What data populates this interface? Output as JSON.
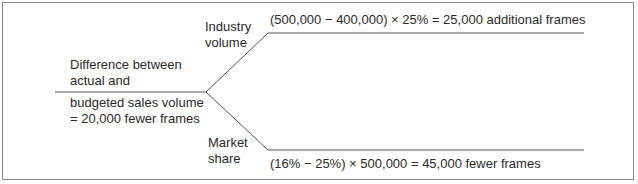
{
  "diagram": {
    "root": {
      "label_above": [
        "Difference between",
        "actual and"
      ],
      "label_below": [
        "budgeted sales volume",
        "= 20,000 fewer frames"
      ]
    },
    "branches": [
      {
        "name": [
          "Industry",
          "volume"
        ],
        "result": "(500,000 − 400,000) × 25% = 25,000 additional frames"
      },
      {
        "name": [
          "Market",
          "share"
        ],
        "result": "(16% − 25%) × 500,000 = 45,000 fewer frames"
      }
    ]
  }
}
